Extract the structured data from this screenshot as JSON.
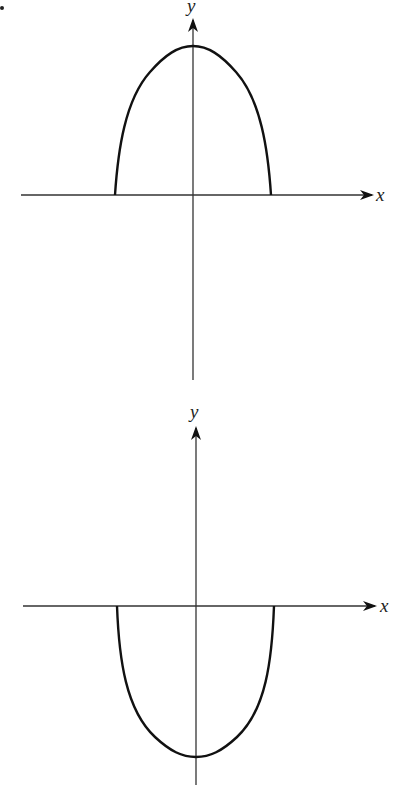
{
  "figure": {
    "marker": "•",
    "panels": [
      {
        "id": "top",
        "x_label": "x",
        "y_label": "y",
        "description": "Concave-down arch above the x-axis, symmetric about the y-axis"
      },
      {
        "id": "bottom",
        "x_label": "x",
        "y_label": "y",
        "description": "Concave-up bowl below the x-axis, symmetric about the y-axis"
      }
    ]
  },
  "colors": {
    "line": "#111111",
    "axis": "#333333",
    "background": "#ffffff"
  }
}
